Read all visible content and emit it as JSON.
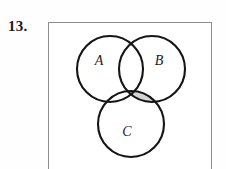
{
  "problem": {
    "number": "13."
  },
  "figure": {
    "type": "venn-diagram",
    "set_count": 3,
    "labels": {
      "a": "A",
      "b": "B",
      "c": "C"
    },
    "shaded_region": "B-and-C-not-A",
    "colors": {
      "stroke": "#151515",
      "shade_fill": "#d6d4d2",
      "frame_border": "#8d8d8d",
      "background": "#ffffff",
      "label_text": "#1b1b1b"
    },
    "circles": [
      {
        "id": "A",
        "cx": 110,
        "cy": 69,
        "r": 33
      },
      {
        "id": "B",
        "cx": 152,
        "cy": 69,
        "r": 33
      },
      {
        "id": "C",
        "cx": 131,
        "cy": 124,
        "r": 33
      }
    ],
    "label_positions": [
      {
        "id": "A",
        "x": 99,
        "y": 65
      },
      {
        "id": "B",
        "x": 155,
        "y": 65
      },
      {
        "id": "C",
        "x": 124,
        "y": 135
      }
    ],
    "frame": {
      "x": 48,
      "y": 22,
      "width": 164,
      "height": 150
    }
  }
}
